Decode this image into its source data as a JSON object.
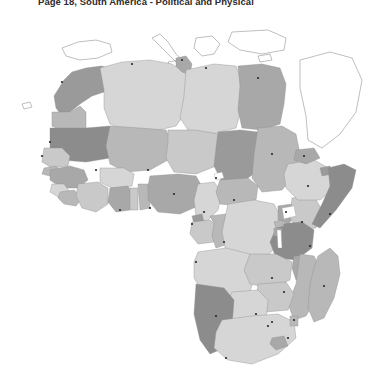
{
  "document": {
    "title": "Page 18, South America - Political and Physical",
    "background_color": "#ffffff"
  },
  "map": {
    "name": "africa-political-physical-map",
    "projection_note": "grayscale political map of the African continent",
    "ocean_color": "#ffffff",
    "border_color": "#8e8e8e",
    "coastline_color": "#6f6f6f",
    "city_dot_color": "#2a2a2a",
    "fill_palette": {
      "light": "#d6d6d6",
      "light_mid": "#c9c9c9",
      "mid": "#b8b8b8",
      "mid_dark": "#a8a8a8",
      "dark": "#9a9a9a",
      "darker": "#8c8c8c"
    },
    "regions": [
      {
        "name": "Morocco",
        "shade": "dark",
        "d": "M64,72 L72,64 L86,60 L101,58 L113,61 L120,68 L118,79 L104,84 L92,88 L80,96 L70,104 L62,108 L56,100 L54,88 Z"
      },
      {
        "name": "Western Sahara",
        "shade": "mid",
        "d": "M52,104 L70,104 L80,98 L86,104 L86,122 L60,122 L52,118 Z"
      },
      {
        "name": "Algeria",
        "shade": "light",
        "d": "M100,60 L122,54 L150,52 L172,56 L186,66 L190,84 L186,104 L176,118 L150,124 L124,122 L110,116 L104,100 L104,82 Z"
      },
      {
        "name": "Tunisia",
        "shade": "mid_dark",
        "d": "M176,50 L186,48 L192,56 L190,66 L182,64 L176,58 Z"
      },
      {
        "name": "Libya",
        "shade": "light",
        "d": "M186,62 L214,56 L236,58 L242,74 L242,98 L236,120 L212,126 L188,122 L180,110 L184,88 Z"
      },
      {
        "name": "Egypt",
        "shade": "mid_dark",
        "d": "M238,58 L262,56 L280,60 L286,76 L284,96 L280,116 L262,122 L242,120 L238,102 L240,78 Z"
      },
      {
        "name": "Mauritania",
        "shade": "darker",
        "d": "M50,120 L86,120 L110,118 L116,134 L110,150 L86,154 L62,152 L50,142 Z"
      },
      {
        "name": "Mali",
        "shade": "mid",
        "d": "M110,118 L140,120 L166,122 L172,136 L168,152 L150,162 L126,164 L110,156 L106,138 Z"
      },
      {
        "name": "Niger",
        "shade": "light_mid",
        "d": "M168,122 L196,122 L218,126 L222,142 L216,158 L196,166 L174,164 L166,150 L168,134 Z"
      },
      {
        "name": "Chad",
        "shade": "dark",
        "d": "M218,124 L240,122 L258,124 L262,142 L256,164 L240,176 L222,174 L214,158 L216,140 Z"
      },
      {
        "name": "Sudan",
        "shade": "mid",
        "d": "M258,120 L282,118 L296,126 L300,146 L294,168 L282,182 L262,184 L252,170 L254,146 Z"
      },
      {
        "name": "Senegal",
        "shade": "light_mid",
        "d": "M44,140 L62,140 L70,148 L68,158 L52,160 L42,154 Z"
      },
      {
        "name": "Guinea-Bissau",
        "shade": "mid",
        "d": "M44,160 L56,158 L60,164 L50,168 L42,166 Z"
      },
      {
        "name": "Guinea",
        "shade": "mid_dark",
        "d": "M50,162 L70,158 L84,162 L88,172 L78,180 L62,180 L50,172 Z"
      },
      {
        "name": "Sierra Leone",
        "shade": "light",
        "d": "M52,176 L64,176 L70,184 L60,190 L50,184 Z"
      },
      {
        "name": "Liberia",
        "shade": "mid",
        "d": "M60,184 L74,182 L82,190 L76,198 L64,196 L58,190 Z"
      },
      {
        "name": "Ivory Coast",
        "shade": "light_mid",
        "d": "M78,176 L98,174 L108,180 L108,196 L96,204 L82,200 L76,188 Z"
      },
      {
        "name": "Burkina Faso",
        "shade": "light",
        "d": "M100,160 L124,160 L134,166 L132,178 L112,180 L100,174 Z"
      },
      {
        "name": "Ghana",
        "shade": "mid_dark",
        "d": "M110,180 L128,178 L134,188 L130,202 L116,204 L108,194 Z"
      },
      {
        "name": "Togo",
        "shade": "light_mid",
        "d": "M130,180 L138,180 L138,202 L130,202 Z"
      },
      {
        "name": "Benin",
        "shade": "mid",
        "d": "M138,176 L148,176 L150,200 L140,202 Z"
      },
      {
        "name": "Nigeria",
        "shade": "mid_dark",
        "d": "M150,168 L178,166 L196,168 L204,182 L198,198 L180,206 L158,204 L148,192 L148,178 Z"
      },
      {
        "name": "Cameroon",
        "shade": "light",
        "d": "M198,176 L214,174 L222,184 L218,202 L206,214 L196,208 L194,192 Z"
      },
      {
        "name": "Central African Republic",
        "shade": "mid",
        "d": "M220,172 L248,170 L258,178 L256,192 L238,198 L220,196 L216,184 Z"
      },
      {
        "name": "Equatorial Guinea",
        "shade": "dark",
        "d": "M192,208 L202,206 L204,214 L194,216 Z"
      },
      {
        "name": "Gabon",
        "shade": "light_mid",
        "d": "M192,214 L210,212 L218,220 L214,234 L198,236 L190,226 Z"
      },
      {
        "name": "Congo",
        "shade": "mid",
        "d": "M210,208 L226,206 L232,218 L228,236 L216,240 L212,228 L214,216 Z"
      },
      {
        "name": "DR Congo",
        "shade": "light",
        "d": "M228,196 L254,192 L274,196 L282,212 L278,236 L264,252 L242,254 L226,244 L222,224 Z"
      },
      {
        "name": "Uganda",
        "shade": "mid_dark",
        "d": "M278,198 L292,196 L296,208 L288,216 L278,212 Z"
      },
      {
        "name": "Kenya",
        "shade": "light_mid",
        "d": "M292,190 L314,188 L322,202 L316,220 L298,222 L290,210 Z"
      },
      {
        "name": "Ethiopia",
        "shade": "light",
        "d": "M288,156 L314,152 L332,162 L334,180 L320,192 L298,192 L286,180 L284,166 Z"
      },
      {
        "name": "Eritrea",
        "shade": "mid_dark",
        "d": "M296,142 L314,140 L320,150 L306,156 L294,152 Z"
      },
      {
        "name": "Djibouti",
        "shade": "dark",
        "d": "M320,160 L330,158 L332,166 L322,168 Z"
      },
      {
        "name": "Somalia",
        "shade": "darker",
        "d": "M328,160 L344,156 L356,162 L352,180 L336,202 L320,220 L312,216 L322,196 L330,178 Z"
      },
      {
        "name": "Tanzania",
        "shade": "darker",
        "d": "M278,216 L302,214 L314,222 L312,240 L296,252 L276,250 L270,234 Z"
      },
      {
        "name": "Rwanda",
        "shade": "mid",
        "d": "M274,214 L282,212 L284,218 L276,220 Z"
      },
      {
        "name": "Burundi",
        "shade": "mid_dark",
        "d": "M274,220 L282,220 L282,228 L274,228 Z"
      },
      {
        "name": "Angola",
        "shade": "light",
        "d": "M198,244 L226,240 L250,246 L256,264 L250,284 L228,290 L204,286 L194,270 L194,254 Z"
      },
      {
        "name": "Zambia",
        "shade": "light_mid",
        "d": "M250,246 L276,246 L292,254 L290,272 L270,280 L250,276 L244,262 Z"
      },
      {
        "name": "Malawi",
        "shade": "mid_dark",
        "d": "M294,248 L304,248 L306,268 L296,272 L292,260 Z"
      },
      {
        "name": "Mozambique",
        "shade": "mid",
        "d": "M300,246 L314,248 L322,264 L318,288 L306,308 L294,312 L288,296 L296,276 L298,260 Z"
      },
      {
        "name": "Zimbabwe",
        "shade": "light_mid",
        "d": "M258,276 L286,274 L294,286 L288,302 L266,304 L256,292 Z"
      },
      {
        "name": "Botswana",
        "shade": "light",
        "d": "M232,284 L258,282 L268,292 L266,312 L248,320 L230,314 L226,298 Z"
      },
      {
        "name": "Namibia",
        "shade": "darker",
        "d": "M196,276 L224,280 L234,292 L232,318 L224,340 L210,346 L200,332 L194,306 Z"
      },
      {
        "name": "South Africa",
        "shade": "light",
        "d": "M222,312 L252,308 L278,306 L294,314 L296,330 L278,346 L252,356 L228,352 L214,340 L216,324 Z"
      },
      {
        "name": "Lesotho",
        "shade": "mid_dark",
        "d": "M272,330 L284,328 L288,338 L276,342 L270,336 Z"
      },
      {
        "name": "Swaziland",
        "shade": "mid",
        "d": "M290,308 L298,308 L298,318 L290,318 Z"
      },
      {
        "name": "Madagascar",
        "shade": "mid",
        "d": "M318,248 L330,240 L338,248 L340,266 L334,290 L324,310 L314,314 L308,300 L310,276 L314,260 Z"
      }
    ],
    "lakes": [
      {
        "name": "Lake Victoria",
        "d": "M282,200 L294,198 L296,208 L284,211 Z"
      },
      {
        "name": "Lake Tanganyika",
        "d": "M277,222 L281,222 L282,240 L278,240 Z"
      },
      {
        "name": "Lake Chad",
        "d": "M214,166 L222,164 L224,170 L216,172 Z"
      }
    ],
    "neighbor_outlines": [
      {
        "name": "Iberian Peninsula",
        "d": "M62,40 L78,34 L96,32 L110,36 L112,44 L98,50 L80,52 L66,48 Z"
      },
      {
        "name": "Italy",
        "d": "M152,30 L160,26 L168,34 L176,46 L182,52 L176,54 L166,44 L158,36 Z"
      },
      {
        "name": "Greece and Aegean",
        "d": "M196,30 L212,28 L220,36 L214,46 L202,48 L194,40 Z"
      },
      {
        "name": "Turkey and Levant",
        "d": "M232,24 L268,22 L286,30 L284,42 L262,46 L240,42 L228,34 Z"
      },
      {
        "name": "Arabian Peninsula",
        "d": "M300,52 L330,44 L352,50 L362,72 L356,104 L340,126 L322,140 L308,132 L306,108 L300,80 Z"
      },
      {
        "name": "Sicily",
        "d": "M168,54 L180,52 L182,58 L170,60 Z"
      },
      {
        "name": "Cyprus",
        "d": "M258,48 L270,46 L272,52 L260,54 Z"
      },
      {
        "name": "Canary Islands",
        "d": "M22,96 L30,94 L32,99 L24,101 Z"
      }
    ],
    "cities": [
      {
        "name": "Rabat",
        "cx": 62,
        "cy": 74
      },
      {
        "name": "Algiers",
        "cx": 132,
        "cy": 56
      },
      {
        "name": "Tunis",
        "cx": 182,
        "cy": 52
      },
      {
        "name": "Tripoli",
        "cx": 206,
        "cy": 60
      },
      {
        "name": "Cairo",
        "cx": 258,
        "cy": 70
      },
      {
        "name": "Nouakchott",
        "cx": 50,
        "cy": 134
      },
      {
        "name": "Dakar",
        "cx": 42,
        "cy": 148
      },
      {
        "name": "Bamako",
        "cx": 96,
        "cy": 162
      },
      {
        "name": "Niamey",
        "cx": 148,
        "cy": 162
      },
      {
        "name": "Ndjamena",
        "cx": 216,
        "cy": 170
      },
      {
        "name": "Khartoum",
        "cx": 272,
        "cy": 146
      },
      {
        "name": "Asmara",
        "cx": 304,
        "cy": 148
      },
      {
        "name": "Abuja",
        "cx": 174,
        "cy": 186
      },
      {
        "name": "Accra",
        "cx": 120,
        "cy": 202
      },
      {
        "name": "Lagos",
        "cx": 150,
        "cy": 200
      },
      {
        "name": "Yaounde",
        "cx": 204,
        "cy": 204
      },
      {
        "name": "Bangui",
        "cx": 234,
        "cy": 192
      },
      {
        "name": "Addis Ababa",
        "cx": 308,
        "cy": 178
      },
      {
        "name": "Mogadishu",
        "cx": 330,
        "cy": 206
      },
      {
        "name": "Nairobi",
        "cx": 302,
        "cy": 214
      },
      {
        "name": "Kampala",
        "cx": 286,
        "cy": 204
      },
      {
        "name": "Kinshasa",
        "cx": 224,
        "cy": 234
      },
      {
        "name": "Libreville",
        "cx": 192,
        "cy": 216
      },
      {
        "name": "Luanda",
        "cx": 196,
        "cy": 254
      },
      {
        "name": "Dar es Salaam",
        "cx": 310,
        "cy": 238
      },
      {
        "name": "Lusaka",
        "cx": 272,
        "cy": 270
      },
      {
        "name": "Harare",
        "cx": 284,
        "cy": 284
      },
      {
        "name": "Antananarivo",
        "cx": 324,
        "cy": 278
      },
      {
        "name": "Windhoek",
        "cx": 216,
        "cy": 308
      },
      {
        "name": "Gaborone",
        "cx": 256,
        "cy": 306
      },
      {
        "name": "Maputo",
        "cx": 294,
        "cy": 312
      },
      {
        "name": "Pretoria",
        "cx": 272,
        "cy": 314
      },
      {
        "name": "Johannesburg",
        "cx": 268,
        "cy": 318
      },
      {
        "name": "Durban",
        "cx": 288,
        "cy": 330
      },
      {
        "name": "Cape Town",
        "cx": 226,
        "cy": 350
      }
    ]
  }
}
